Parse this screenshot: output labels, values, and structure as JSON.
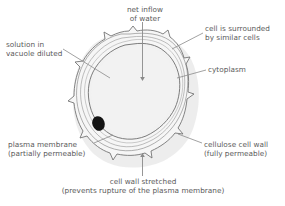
{
  "diagram": {
    "canvas": {
      "width": 285,
      "height": 206
    },
    "colors": {
      "background": "#ffffff",
      "cell_interior": "#f1f1f1",
      "cell_wall_line": "#6e6e6e",
      "nucleus": "#1a1a1a",
      "leader_line": "#8a8a8a",
      "text": "#5b5b5b",
      "shadow": "#d9d9d9"
    },
    "labels": {
      "net_inflow": "net inflow\nof water",
      "surrounded": "cell is surrounded\nby similar cells",
      "vacuole": "solution in\nvacuole diluted",
      "cytoplasm": "cytoplasm",
      "plasma_membrane": "plasma membrane\n(partially permeable)",
      "cellulose_wall": "cellulose cell wall\n(fully permeable)",
      "wall_stretched": "cell wall stretched\n(prevents rupture of the plasma membrane)"
    },
    "parts": {
      "nucleus_name": "nucleus",
      "cell_body_name": "turgid-plant-cell"
    }
  }
}
